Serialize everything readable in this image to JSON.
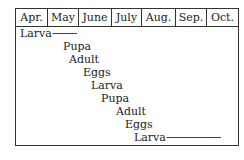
{
  "diagram": {
    "months": [
      "Apr.",
      "May",
      "June",
      "July",
      "Aug.",
      "Sep.",
      "Oct."
    ],
    "stages": [
      {
        "label": "Larva",
        "trail": "---------"
      },
      {
        "label": "Pupa",
        "trail": ""
      },
      {
        "label": "Adult",
        "trail": ""
      },
      {
        "label": "Eggs",
        "trail": ""
      },
      {
        "label": "Larva",
        "trail": ""
      },
      {
        "label": "Pupa",
        "trail": ""
      },
      {
        "label": "Adult",
        "trail": ""
      },
      {
        "label": "Eggs",
        "trail": ""
      },
      {
        "label": "Larva",
        "trail": "--------------------"
      }
    ]
  }
}
